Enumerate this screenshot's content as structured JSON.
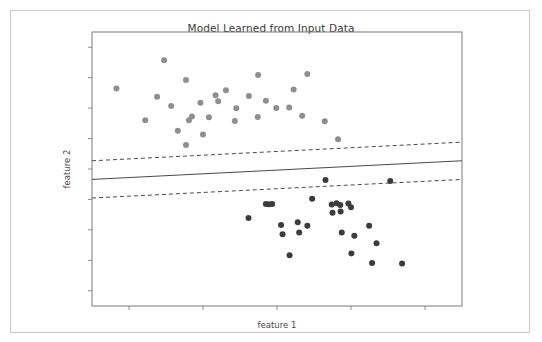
{
  "figure": {
    "title": "Model Learned from Input Data",
    "background": "#ffffff",
    "border_color": "#c9c9c9"
  },
  "axes": {
    "xlabel": "feature 1",
    "ylabel": "feature 2",
    "axis_color": "#7a7a7a",
    "tick_color": "#8a8a8a",
    "x_tick_count": 5,
    "y_tick_count": 9,
    "tick_labels_shown": "none"
  },
  "chart_data": {
    "type": "scatter",
    "title": "Model Learned from Input Data",
    "xlabel": "feature 1",
    "ylabel": "feature 2",
    "xlim": [
      0,
      1
    ],
    "ylim": [
      0,
      1
    ],
    "grid": false,
    "legend": "none",
    "tick_labels": {
      "x": [],
      "y": []
    },
    "series": [
      {
        "name": "class 0",
        "marker": "circle",
        "color": "#8f8f8f",
        "size": 6,
        "points": [
          [
            0.066,
            0.794
          ],
          [
            0.195,
            0.897
          ],
          [
            0.254,
            0.825
          ],
          [
            0.176,
            0.764
          ],
          [
            0.293,
            0.742
          ],
          [
            0.316,
            0.689
          ],
          [
            0.144,
            0.678
          ],
          [
            0.214,
            0.73
          ],
          [
            0.341,
            0.747
          ],
          [
            0.362,
            0.787
          ],
          [
            0.39,
            0.722
          ],
          [
            0.334,
            0.769
          ],
          [
            0.449,
            0.843
          ],
          [
            0.424,
            0.766
          ],
          [
            0.47,
            0.749
          ],
          [
            0.498,
            0.723
          ],
          [
            0.386,
            0.675
          ],
          [
            0.448,
            0.69
          ],
          [
            0.545,
            0.79
          ],
          [
            0.582,
            0.847
          ],
          [
            0.533,
            0.724
          ],
          [
            0.568,
            0.694
          ],
          [
            0.629,
            0.674
          ],
          [
            0.3,
            0.626
          ],
          [
            0.232,
            0.64
          ],
          [
            0.262,
            0.678
          ],
          [
            0.27,
            0.692
          ],
          [
            0.254,
            0.588
          ],
          [
            0.665,
            0.609
          ]
        ]
      },
      {
        "name": "class 1",
        "marker": "circle",
        "color": "#3c3c3c",
        "size": 6,
        "points": [
          [
            0.423,
            0.321
          ],
          [
            0.47,
            0.372
          ],
          [
            0.478,
            0.371
          ],
          [
            0.487,
            0.372
          ],
          [
            0.556,
            0.306
          ],
          [
            0.595,
            0.391
          ],
          [
            0.631,
            0.46
          ],
          [
            0.65,
            0.34
          ],
          [
            0.648,
            0.37
          ],
          [
            0.661,
            0.375
          ],
          [
            0.671,
            0.369
          ],
          [
            0.672,
            0.345
          ],
          [
            0.693,
            0.374
          ],
          [
            0.7,
            0.36
          ],
          [
            0.511,
            0.296
          ],
          [
            0.515,
            0.262
          ],
          [
            0.56,
            0.268
          ],
          [
            0.582,
            0.293
          ],
          [
            0.534,
            0.185
          ],
          [
            0.675,
            0.268
          ],
          [
            0.709,
            0.256
          ],
          [
            0.749,
            0.293
          ],
          [
            0.701,
            0.192
          ],
          [
            0.769,
            0.229
          ],
          [
            0.757,
            0.157
          ],
          [
            0.806,
            0.456
          ],
          [
            0.838,
            0.155
          ]
        ]
      }
    ],
    "lines": [
      {
        "name": "decision-boundary",
        "style": "solid",
        "color": "#4a4a4a",
        "width": 1,
        "x0": 0.0,
        "y0": 0.462,
        "x1": 1.0,
        "y1": 0.53
      },
      {
        "name": "upper-margin",
        "style": "dashed",
        "color": "#4a4a4a",
        "width": 1,
        "x0": 0.0,
        "y0": 0.53,
        "x1": 1.0,
        "y1": 0.598
      },
      {
        "name": "lower-margin",
        "style": "dashed",
        "color": "#4a4a4a",
        "width": 1,
        "x0": 0.0,
        "y0": 0.394,
        "x1": 1.0,
        "y1": 0.462
      }
    ]
  }
}
